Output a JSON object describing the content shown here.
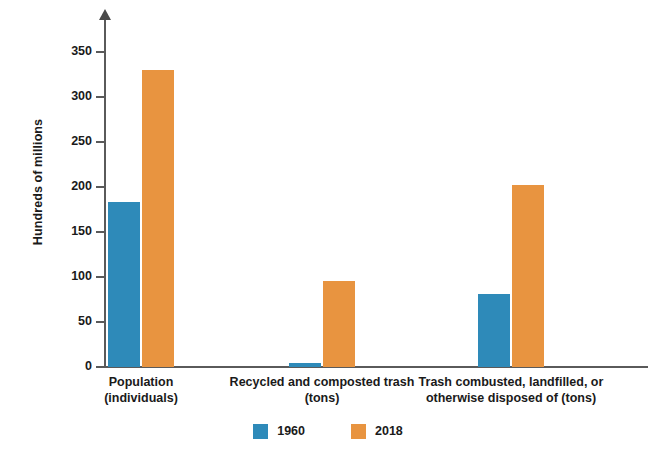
{
  "chart_data": {
    "type": "bar",
    "title": "",
    "subtitle": "",
    "xlabel": "",
    "ylabel": "Hundreds of millions",
    "ylim": [
      0,
      365
    ],
    "yticks": [
      0,
      50,
      100,
      150,
      200,
      250,
      300,
      350
    ],
    "ytick_labels": [
      "0",
      "50",
      "100",
      "150",
      "200",
      "250",
      "300",
      "350"
    ],
    "grid": false,
    "legend_position": "bottom-center",
    "categories": [
      "Population\n(individuals)",
      "Recycled and composted trash\n(tons)",
      "Trash combusted, landfilled, or\notherwise disposed of (tons)"
    ],
    "category_lines": [
      [
        "Population",
        "(individuals)"
      ],
      [
        "Recycled and composted trash",
        "(tons)"
      ],
      [
        "Trash combusted, landfilled, or",
        "otherwise disposed of (tons)"
      ]
    ],
    "series": [
      {
        "name": "1960",
        "color": "#2e8ab9",
        "values": [
          183,
          4,
          81
        ]
      },
      {
        "name": "2018",
        "color": "#e89440",
        "values": [
          330,
          96,
          202
        ]
      }
    ]
  },
  "axes": {
    "y_axis_title": "Hundreds of millions"
  },
  "legend": {
    "items": [
      {
        "label": "1960",
        "color": "#2e8ab9"
      },
      {
        "label": "2018",
        "color": "#e89440"
      }
    ]
  },
  "colors": {
    "series_1960": "#2e8ab9",
    "series_2018": "#e89440",
    "axis": "#5a5a5a",
    "text": "#1a1a1a",
    "background": "#ffffff"
  }
}
